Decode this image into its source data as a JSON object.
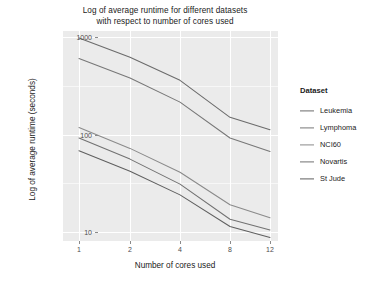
{
  "chart_data": {
    "type": "line",
    "title": "Log of average runtime for different datasets with respect to number of cores used",
    "title_line1": "Log of average runtime for different datasets",
    "title_line2": "with respect to number of cores used",
    "xlabel": "Number of cores used",
    "ylabel": "Log of average runtime (seconds)",
    "x": [
      1,
      2,
      4,
      8,
      12
    ],
    "xtick_labels": [
      "1",
      "2",
      "4",
      "8",
      "12"
    ],
    "ytick_labels": [
      "1000",
      "100",
      "10"
    ],
    "ytick_values": [
      1000,
      100,
      10
    ],
    "yscale": "log",
    "ylim": [
      7,
      1400
    ],
    "grid": true,
    "legend_title": "Dataset",
    "legend_position": "right",
    "series": [
      {
        "name": "Leukemia",
        "color": "#6b6b6b",
        "values": [
          980,
          620,
          360,
          150,
          112
        ]
      },
      {
        "name": "Lymphoma",
        "color": "#777777",
        "values": [
          600,
          380,
          215,
          92,
          67
        ]
      },
      {
        "name": "NCI60",
        "color": "#8a8a8a",
        "values": [
          118,
          72,
          41,
          19,
          14
        ]
      },
      {
        "name": "Novartis",
        "color": "#717171",
        "values": [
          92,
          56,
          31,
          13.5,
          10.5
        ]
      },
      {
        "name": "St Jude",
        "color": "#5f5f5f",
        "values": [
          68,
          42,
          24,
          11.4,
          8.8
        ]
      }
    ]
  },
  "colors": {
    "panel_background": "#ebebeb",
    "page_background": "#ffffff",
    "gridline_major": "#ffffff",
    "gridline_minor": "#f7f7f7",
    "text": "#1a1a1a",
    "tick_text": "#4d4d4d"
  }
}
